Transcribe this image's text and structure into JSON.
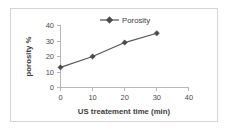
{
  "chart_data": {
    "type": "line",
    "title": "",
    "xlabel": "US treatement time (min)",
    "ylabel": "porosity %",
    "x": [
      0,
      10,
      20,
      30
    ],
    "values": [
      13,
      20,
      29,
      35
    ],
    "series": [
      {
        "name": "Porosity",
        "values": [
          13,
          20,
          29,
          35
        ]
      }
    ],
    "xlim": [
      0,
      40
    ],
    "ylim": [
      0,
      40
    ],
    "xticks": [
      "0",
      "10",
      "20",
      "30",
      "40"
    ],
    "yticks": [
      "0",
      "10",
      "20",
      "30",
      "40"
    ],
    "grid": false,
    "legend": {
      "position": "top-center",
      "entries": [
        "Porosity"
      ]
    },
    "marker": "diamond",
    "line_color": "#56575a",
    "marker_color": "#4a4b4e",
    "frame_color": "#d4d4d4",
    "axis_color": "#a6a6a6",
    "background": "#ffffff"
  },
  "legend": {
    "series_label": "Porosity"
  },
  "axes": {
    "y_title": "porosity %",
    "x_title": "US treatement time (min)",
    "y_tick_0": "0",
    "y_tick_1": "10",
    "y_tick_2": "20",
    "y_tick_3": "30",
    "y_tick_4": "40",
    "x_tick_0": "0",
    "x_tick_1": "10",
    "x_tick_2": "20",
    "x_tick_3": "30",
    "x_tick_4": "40"
  }
}
